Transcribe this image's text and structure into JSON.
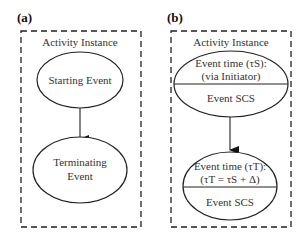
{
  "panels": [
    {
      "label": "(a)",
      "container_title": "Activity Instance",
      "start_node": {
        "text": "Starting Event"
      },
      "end_node": {
        "lines": [
          "Terminating",
          "Event"
        ]
      }
    },
    {
      "label": "(b)",
      "container_title": "Activity Instance",
      "start_node": {
        "top_lines": [
          "Event time (τS):",
          "(via Initiator)"
        ],
        "bottom": "Event SCS"
      },
      "end_node": {
        "top_lines": [
          "Event time (τT):",
          "(τT = τS + Δ)"
        ],
        "bottom": "Event SCS"
      }
    }
  ]
}
